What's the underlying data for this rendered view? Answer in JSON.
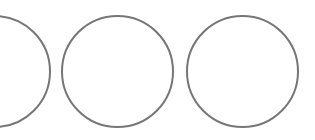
{
  "canvas": {
    "width": 315,
    "height": 140,
    "background": "#ffffff"
  },
  "stroke": {
    "color": "#767676",
    "width": 2
  },
  "circles": [
    {
      "id": "circle-1",
      "cx": -6,
      "cy": 71,
      "diameter": 113
    },
    {
      "id": "circle-2",
      "cx": 117,
      "cy": 71,
      "diameter": 113
    },
    {
      "id": "circle-3",
      "cx": 242,
      "cy": 71,
      "diameter": 113
    }
  ]
}
